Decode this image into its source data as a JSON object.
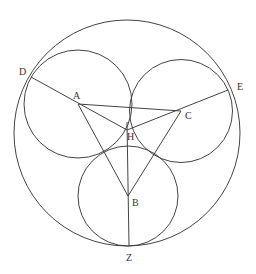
{
  "diagram": {
    "type": "geometry",
    "colors": {
      "line": "#444444",
      "text": "#333333",
      "background": "#ffffff"
    },
    "points": {
      "A": {
        "label": "A",
        "x": 78,
        "y": 104
      },
      "B": {
        "label": "B",
        "x": 128,
        "y": 196
      },
      "C": {
        "label": "C",
        "x": 181,
        "y": 111
      },
      "D": {
        "label": "D",
        "x": 31,
        "y": 77
      },
      "E": {
        "label": "E",
        "x": 228,
        "y": 90
      },
      "H": {
        "label": "H",
        "x": 127,
        "y": 130
      },
      "Z": {
        "label": "Z",
        "x": 129,
        "y": 246
      }
    },
    "circles": [
      {
        "name": "outer",
        "cx": 127,
        "cy": 133,
        "r": 113
      },
      {
        "name": "circle-A",
        "cx": 78,
        "cy": 104,
        "r": 54
      },
      {
        "name": "circle-C",
        "cx": 181,
        "cy": 111,
        "r": 51.5
      },
      {
        "name": "circle-B",
        "cx": 128,
        "cy": 196,
        "r": 50
      }
    ],
    "segments": [
      [
        "A",
        "C"
      ],
      [
        "A",
        "B"
      ],
      [
        "C",
        "B"
      ],
      [
        "D",
        "H"
      ],
      [
        "E",
        "H"
      ],
      [
        "Z",
        "H"
      ]
    ]
  }
}
